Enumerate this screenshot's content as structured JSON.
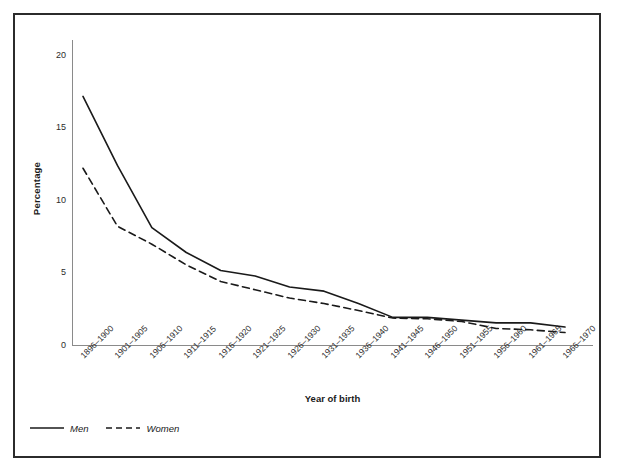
{
  "figure": {
    "caption": ""
  },
  "axes": {
    "y_title": "Percentage",
    "x_title": "Year of birth",
    "y_ticks": [
      "0",
      "5",
      "10",
      "15",
      "20"
    ]
  },
  "legend": {
    "position": "bottom-left",
    "items": [
      {
        "label": "Men",
        "style": "solid"
      },
      {
        "label": "Women",
        "style": "dashed"
      }
    ]
  },
  "colors": {
    "line": "#1a1a1a",
    "axis": "#8a8a8a",
    "frame": "#2b2b2b",
    "background": "#ffffff"
  },
  "chart_data": {
    "type": "line",
    "title": "",
    "xlabel": "Year of birth",
    "ylabel": "Percentage",
    "ylim": [
      0,
      21
    ],
    "yticks": [
      0,
      5,
      10,
      15,
      20
    ],
    "grid": false,
    "legend": "bottom-left",
    "categories": [
      "1896–1900",
      "1901–1905",
      "1906–1910",
      "1911–1915",
      "1916–1920",
      "1921–1925",
      "1926–1930",
      "1931–1935",
      "1936–1940",
      "1941–1945",
      "1946–1950",
      "1951–1955",
      "1956–1960",
      "1961–1965",
      "1966–1970"
    ],
    "series": [
      {
        "name": "Men",
        "style": "solid",
        "values": [
          18.0,
          13.0,
          8.5,
          6.7,
          5.4,
          5.0,
          4.2,
          3.9,
          3.0,
          2.0,
          2.0,
          1.8,
          1.6,
          1.6,
          1.3
        ]
      },
      {
        "name": "Women",
        "style": "dashed",
        "values": [
          12.8,
          8.6,
          7.3,
          5.8,
          4.6,
          4.0,
          3.4,
          3.0,
          2.5,
          1.95,
          1.9,
          1.7,
          1.2,
          1.1,
          0.9
        ]
      }
    ]
  }
}
